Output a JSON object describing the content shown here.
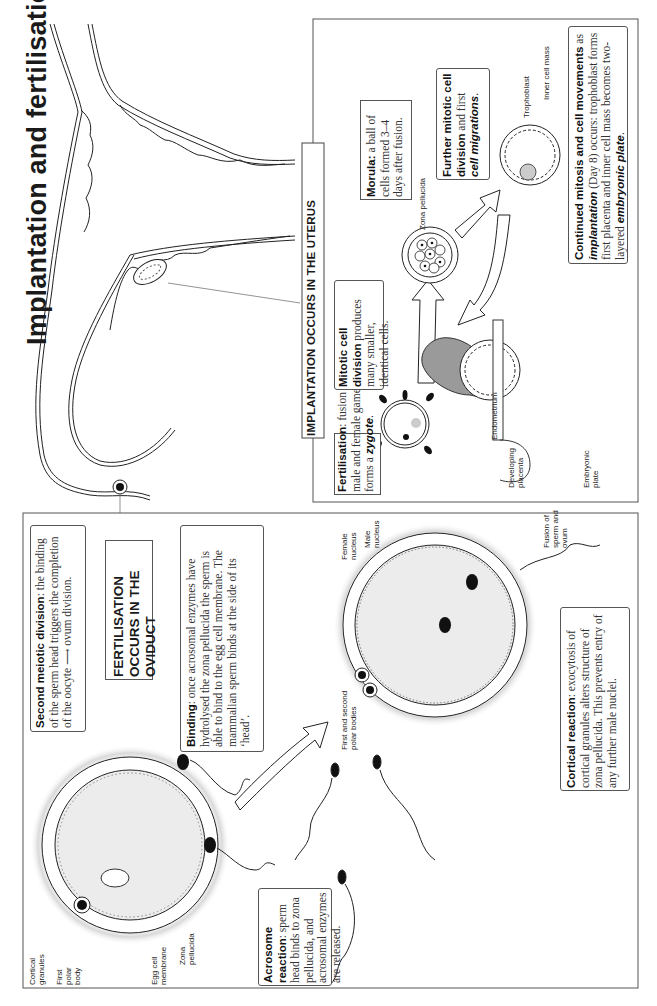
{
  "title": "Implantation and fertilisation",
  "implantation_panel": {
    "header": "IMPLANTATION OCCURS IN THE UTERUS",
    "fertilisation_box": {
      "bold": "Fertilisation",
      "text": ": fusion of male and female gametes forms a ",
      "emph": "zygote",
      "end": "."
    },
    "mitotic_box": {
      "bold": "Mitotic cell division",
      "text": " produces many smaller, identical cells."
    },
    "morula_box": {
      "bold": "Morula:",
      "text": " a ball of cells formed 3–4 days after fusion."
    },
    "further_box": {
      "bold": "Further mitotic cell division",
      "text": " and first ",
      "emph": "cell migrations",
      "end": "."
    },
    "continued_box": {
      "bold": "Continued mitosis and cell movements",
      "text1": " as ",
      "emph1": "implantation",
      "text2": " (Day 8) occurs: trophoblast forms first placenta and inner cell mass becomes two-layered ",
      "emph2": "embryonic plate",
      "end": "."
    },
    "labels": {
      "zona_pellucida": "Zona pellucida",
      "trophoblast": "Trophoblast",
      "inner_cell_mass": "Inner cell mass",
      "endometrium": "Endometrium",
      "developing_placenta": "Developing placenta",
      "embryonic_plate": "Embryonic plate"
    }
  },
  "fertilisation_panel": {
    "header": "FERTILISATION OCCURS IN THE OVIDUCT",
    "second_meiotic_box": {
      "bold": "Second meiotic division",
      "text": ": the binding of the sperm head triggers the completion of the oocyte ⟶ ovum division."
    },
    "binding_box": {
      "bold": "Binding",
      "text": ": once acrosomal enzymes have hydrolysed the zona pellucida the sperm is able to bind to the egg cell membrane. The mammalian sperm binds at the side of its ‘head’."
    },
    "acrosome_box": {
      "bold": "Acrosome reaction",
      "text": ": sperm head binds to zona pellucida, and acrosomal enzymes are released."
    },
    "cortical_box": {
      "bold": "Cortical reaction",
      "text": ": exocytosis of cortical granules alters structure of zona pellucida. This prevents entry of any further male nuclei."
    },
    "labels": {
      "cortical_granules": "Cortical granules",
      "first_polar_body": "First polar body",
      "egg_cell_membrane": "Egg cell membrane",
      "zona_pellucida": "Zona pellucida",
      "first_second_polar_bodies": "First and second polar bodies",
      "female_nucleus": "Female nucleus",
      "male_nucleus": "Male nucleus",
      "fusion": "Fusion of sperm and ovum"
    }
  }
}
